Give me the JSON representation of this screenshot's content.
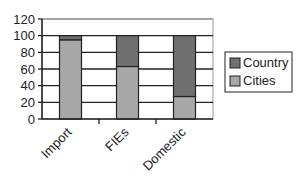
{
  "chart_data": {
    "type": "bar",
    "stacked": true,
    "percent": true,
    "title": "",
    "xlabel": "",
    "ylabel": "",
    "categories": [
      "Import",
      "FIEs",
      "Domestic"
    ],
    "series": [
      {
        "name": "Cities",
        "values": [
          95,
          63,
          27
        ],
        "color": "#a8a8a8"
      },
      {
        "name": "Country",
        "values": [
          5,
          37,
          73
        ],
        "color": "#707070"
      }
    ],
    "ylim": [
      0,
      120
    ],
    "yticks": [
      "0",
      "20",
      "40",
      "60",
      "80",
      "100",
      "120"
    ],
    "grid": true,
    "legend": {
      "position": "right",
      "entries": [
        "Country",
        "Cities"
      ]
    }
  }
}
